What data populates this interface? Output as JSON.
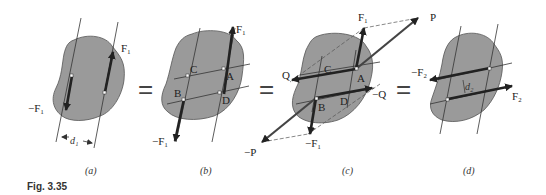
{
  "figure": {
    "caption": "Fig. 3.35",
    "colors": {
      "body_fill": "#9a9a9a",
      "body_stroke": "#555555",
      "arrow": "#222222",
      "thin_line": "#333333",
      "dashed": "#555555",
      "background": "#ffffff"
    },
    "equals_sign": "=",
    "panels": [
      {
        "id": "a",
        "caption": "(a)",
        "labels": {
          "force_up": "F₁",
          "force_down": "−F₁",
          "distance": "d₁"
        }
      },
      {
        "id": "b",
        "caption": "(b)",
        "labels": {
          "force_up": "F₁",
          "force_down": "−F₁",
          "point_A": "A",
          "point_B": "B",
          "point_C": "C",
          "point_D": "D"
        }
      },
      {
        "id": "c",
        "caption": "(c)",
        "labels": {
          "force_up": "F₁",
          "force_down": "−F₁",
          "force_P": "P",
          "force_neg_P": "−P",
          "force_Q": "Q",
          "force_neg_Q": "−Q",
          "point_A": "A",
          "point_B": "B",
          "point_C": "C",
          "point_D": "D"
        }
      },
      {
        "id": "d",
        "caption": "(d)",
        "labels": {
          "force_right": "F₂",
          "force_left": "−F₂",
          "distance": "d₂"
        }
      }
    ]
  }
}
